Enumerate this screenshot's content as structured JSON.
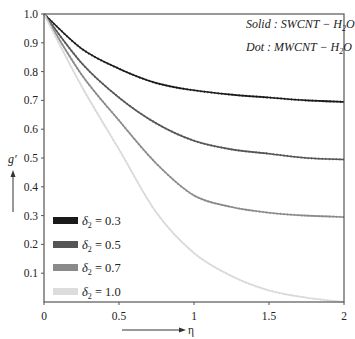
{
  "chart_data": {
    "type": "line",
    "title": "",
    "xlabel": "η",
    "ylabel": "g'",
    "xlim": [
      0,
      2
    ],
    "ylim": [
      0,
      1.0
    ],
    "x_ticks": [
      "0",
      "0.5",
      "1",
      "1.5",
      "2"
    ],
    "y_ticks": [
      "0.1",
      "0.2",
      "0.3",
      "0.4",
      "0.5",
      "0.6",
      "0.7",
      "0.8",
      "0.9",
      "1.0"
    ],
    "grid": false,
    "legend_position": "lower left",
    "annotations": [
      "Solid : SWCNT − H2O",
      "Dot : MWCNT − H2O"
    ],
    "x": [
      0,
      0.25,
      0.5,
      0.75,
      1.0,
      1.25,
      1.5,
      1.75,
      2.0
    ],
    "series": [
      {
        "name": "δ2 = 0.3",
        "color": "#1a1a1a",
        "values": [
          1.0,
          0.88,
          0.81,
          0.76,
          0.735,
          0.72,
          0.71,
          0.7,
          0.695
        ]
      },
      {
        "name": "δ2 = 0.5",
        "color": "#555555",
        "values": [
          1.0,
          0.83,
          0.71,
          0.62,
          0.56,
          0.53,
          0.515,
          0.5,
          0.495
        ]
      },
      {
        "name": "δ2 = 0.7",
        "color": "#8a8a8a",
        "values": [
          1.0,
          0.79,
          0.63,
          0.48,
          0.37,
          0.33,
          0.31,
          0.3,
          0.295
        ]
      },
      {
        "name": "δ2 = 1.0",
        "color": "#d9d9d9",
        "values": [
          1.0,
          0.75,
          0.53,
          0.31,
          0.17,
          0.09,
          0.04,
          0.015,
          0.0
        ]
      }
    ]
  },
  "labels": {
    "annotation_solid": "Solid : SWCNT − H",
    "annotation_solid_sub": "2",
    "annotation_solid_end": "O",
    "annotation_dot": "Dot : MWCNT − H",
    "annotation_dot_sub": "2",
    "annotation_dot_end": "O",
    "ylabel": "g′",
    "xlabel": "η",
    "legend": [
      {
        "prefix": "δ",
        "sub": "2",
        "suffix": " = 0.3",
        "color": "#1a1a1a"
      },
      {
        "prefix": "δ",
        "sub": "2",
        "suffix": " = 0.5",
        "color": "#555555"
      },
      {
        "prefix": "δ",
        "sub": "2",
        "suffix": " = 0.7",
        "color": "#8a8a8a"
      },
      {
        "prefix": "δ",
        "sub": "2",
        "suffix": " = 1.0",
        "color": "#dcdcdc"
      }
    ]
  }
}
